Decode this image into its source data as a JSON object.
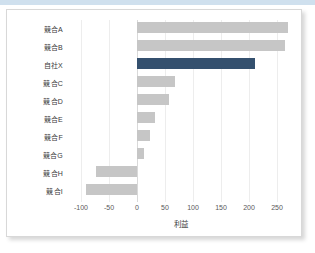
{
  "chart_data": {
    "type": "bar",
    "orientation": "horizontal",
    "title": "",
    "xlabel": "利益",
    "ylabel": "",
    "xlim": [
      -110,
      285
    ],
    "grid": true,
    "legend": false,
    "xticks": [
      "-100",
      "-50",
      "0",
      "50",
      "100",
      "150",
      "200",
      "250"
    ],
    "xtick_values": [
      -100,
      -50,
      0,
      50,
      100,
      150,
      200,
      250
    ],
    "categories": [
      "競合A",
      "競合B",
      "自社X",
      "競合C",
      "競合D",
      "競合E",
      "競合F",
      "競合G",
      "競合H",
      "競合I"
    ],
    "values": [
      270,
      265,
      210,
      67,
      57,
      33,
      24,
      13,
      -73,
      -91
    ],
    "highlight_category": "自社X",
    "colors": {
      "bar": "#c6c6c6",
      "highlight_bar": "#34506e",
      "grid": "#ededed",
      "zero_line": "#d9d9d9",
      "text": "#3a3a3a",
      "tick_text": "#5a5a5a",
      "card_background": "#ffffff",
      "card_border": "#d8d8d8",
      "top_strip": "#cfe0ee"
    }
  }
}
